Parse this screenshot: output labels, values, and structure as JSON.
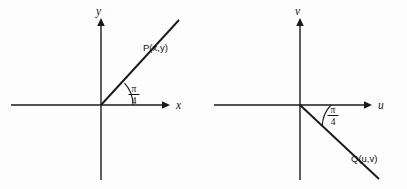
{
  "figure": {
    "background_color": "#fdfdfd",
    "stroke_color": "#1a1a1a",
    "text_color": "#111111",
    "panels": [
      {
        "id": "left-panel",
        "name": "xy-plane",
        "horizontal_axis_label": "x",
        "vertical_axis_label": "y",
        "origin": {
          "x": 101,
          "y": 105
        },
        "horizontal_axis": {
          "x1": 11,
          "x2": 166,
          "y": 105
        },
        "vertical_axis": {
          "y1": 22,
          "y2": 180,
          "x": 101
        },
        "ray": {
          "from": {
            "x": 101,
            "y": 105
          },
          "to": {
            "x": 179,
            "y": 20
          },
          "angle_degrees": 45,
          "direction": "up-right"
        },
        "angle_label": {
          "numerator": "π",
          "denominator": "4"
        },
        "point_label": {
          "name": "P",
          "coords": "(x,y)",
          "full": "P(x,y)"
        }
      },
      {
        "id": "right-panel",
        "name": "uv-plane",
        "horizontal_axis_label": "u",
        "vertical_axis_label": "v",
        "origin": {
          "x": 300,
          "y": 105
        },
        "horizontal_axis": {
          "x1": 214,
          "x2": 368,
          "y": 105
        },
        "vertical_axis": {
          "y1": 22,
          "y2": 180,
          "x": 300
        },
        "ray": {
          "from": {
            "x": 300,
            "y": 105
          },
          "to": {
            "x": 379,
            "y": 179
          },
          "angle_degrees": -45,
          "direction": "down-right"
        },
        "angle_label": {
          "numerator": "π",
          "denominator": "4"
        },
        "point_label": {
          "name": "Q",
          "coords": "(u,v)",
          "full": "Q(u,v)"
        }
      }
    ]
  }
}
